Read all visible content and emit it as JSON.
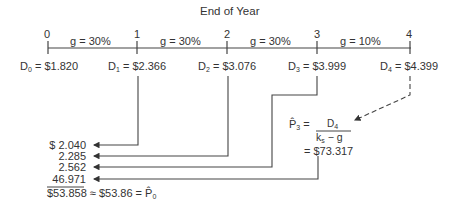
{
  "title": "End of Year",
  "periods": [
    "0",
    "1",
    "2",
    "3",
    "4"
  ],
  "growth_labels": [
    "g = 30%",
    "g = 30%",
    "g = 30%",
    "g = 10%"
  ],
  "dividends": [
    {
      "sym": "D",
      "sub": "0",
      "value": "= $1.820"
    },
    {
      "sym": "D",
      "sub": "1",
      "value": "= $2.366"
    },
    {
      "sym": "D",
      "sub": "2",
      "value": "= $3.076"
    },
    {
      "sym": "D",
      "sub": "3",
      "value": "= $3.999"
    },
    {
      "sym": "D",
      "sub": "4",
      "value": "= $4.399"
    }
  ],
  "terminal": {
    "lhs_sym": "P̂",
    "lhs_sub": "3",
    "eq": "=",
    "numerator_sym": "D",
    "numerator_sub": "4",
    "denominator_k": "k",
    "denominator_k_sub": "s",
    "denominator_rest": " − g",
    "result": "= $73.317"
  },
  "present_values": [
    "$  2.040",
    "2.285",
    "2.562",
    "46.971"
  ],
  "total": {
    "sum": "$53.858",
    "approx": "≈ $53.86 =",
    "p_sym": "P̂",
    "p_sub": "0"
  },
  "colors": {
    "line": "#333333",
    "text": "#333333"
  }
}
